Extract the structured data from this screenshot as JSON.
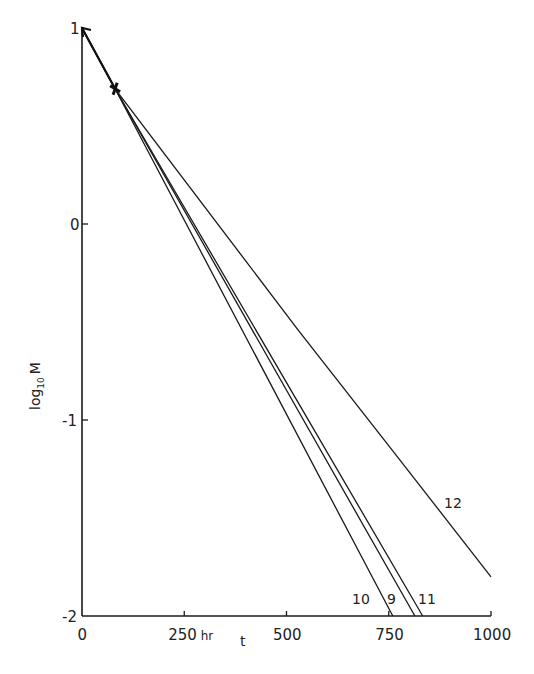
{
  "chart_data": {
    "type": "line",
    "title": "",
    "xlabel": "t",
    "x_unit_label": "hr",
    "ylabel": "log10 M",
    "xlim": [
      0,
      1000
    ],
    "ylim": [
      -2,
      1
    ],
    "grid": false,
    "x_ticks": [
      0,
      250,
      500,
      750,
      1000
    ],
    "x_tick_labels": [
      "0",
      "250 hr",
      "500",
      "750",
      "1000"
    ],
    "y_ticks": [
      1,
      0,
      -1,
      -2
    ],
    "y_tick_labels": [
      "1",
      "0",
      "-1",
      "-2"
    ],
    "shared_start": {
      "t": 0,
      "logM": 1
    },
    "marker_point": {
      "t": 81,
      "logM": 0.69,
      "marker": "cross"
    },
    "series": [
      {
        "name": "10",
        "points": [
          [
            0,
            1
          ],
          [
            81,
            0.69
          ],
          [
            760,
            -2
          ]
        ]
      },
      {
        "name": "9",
        "points": [
          [
            0,
            1
          ],
          [
            81,
            0.69
          ],
          [
            814,
            -2
          ]
        ]
      },
      {
        "name": "11",
        "points": [
          [
            0,
            1
          ],
          [
            81,
            0.69
          ],
          [
            833,
            -2
          ]
        ]
      },
      {
        "name": "12",
        "points": [
          [
            0,
            1
          ],
          [
            81,
            0.69
          ],
          [
            528,
            -0.54
          ],
          [
            757,
            -1.15
          ],
          [
            1000,
            -1.8
          ]
        ]
      }
    ],
    "annotations": [
      {
        "text": "10",
        "near": "end of series 10"
      },
      {
        "text": "9",
        "near": "end of series 9"
      },
      {
        "text": "11",
        "near": "end of series 11"
      },
      {
        "text": "12",
        "near": "series 12, around t=900"
      }
    ]
  },
  "labels": {
    "ylabel_main": "log",
    "ylabel_sub": "10",
    "ylabel_var": "M",
    "xlabel": "t"
  },
  "colors": {
    "ink": "#1a1a1a",
    "background": "#ffffff"
  }
}
